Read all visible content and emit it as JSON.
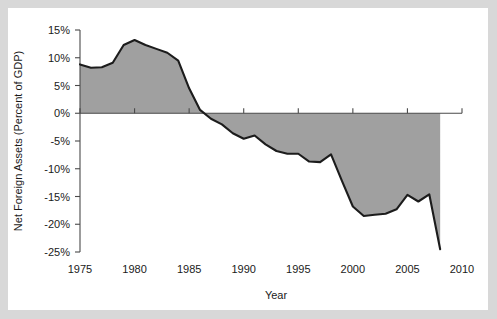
{
  "chart_data": {
    "type": "area",
    "title": "",
    "subtitle": "",
    "xlabel": "Year",
    "ylabel": "Net Foreign Assets (Percent of GDP)",
    "xlim": [
      1975,
      2010
    ],
    "ylim": [
      -25,
      15
    ],
    "grid": false,
    "legend": "none",
    "baseline": 0,
    "area_color": "#a0a0a0",
    "line_color": "#1c1c1c",
    "axis_color": "#4a4a4a",
    "background_color": "#ffffff",
    "x_tick_labels": [
      "1975",
      "1980",
      "1985",
      "1990",
      "1995",
      "2000",
      "2005",
      "2010"
    ],
    "x_ticks": [
      1975,
      1980,
      1985,
      1990,
      1995,
      2000,
      2005,
      2010
    ],
    "y_tick_labels": [
      "15%",
      "10%",
      "5%",
      "0%",
      "-5%",
      "-10%",
      "-15%",
      "-20%",
      "-25%"
    ],
    "y_ticks": [
      15,
      10,
      5,
      0,
      -5,
      -10,
      -15,
      -20,
      -25
    ],
    "series": [
      {
        "name": "Net Foreign Assets (Percent of GDP)",
        "x": [
          1975,
          1976,
          1977,
          1978,
          1979,
          1980,
          1981,
          1982,
          1983,
          1984,
          1985,
          1986,
          1987,
          1988,
          1989,
          1990,
          1991,
          1992,
          1993,
          1994,
          1995,
          1996,
          1997,
          1998,
          1999,
          2000,
          2001,
          2002,
          2003,
          2004,
          2005,
          2006,
          2007,
          2008
        ],
        "values": [
          8.8,
          8.2,
          8.3,
          9.1,
          12.3,
          13.2,
          12.3,
          11.6,
          10.9,
          9.5,
          4.5,
          0.6,
          -1.0,
          -2.0,
          -3.6,
          -4.6,
          -4.0,
          -5.6,
          -6.8,
          -7.3,
          -7.3,
          -8.7,
          -8.8,
          -7.4,
          -12.2,
          -16.8,
          -18.5,
          -18.3,
          -18.1,
          -17.3,
          -14.7,
          -15.9,
          -14.6,
          -24.5
        ]
      }
    ]
  }
}
